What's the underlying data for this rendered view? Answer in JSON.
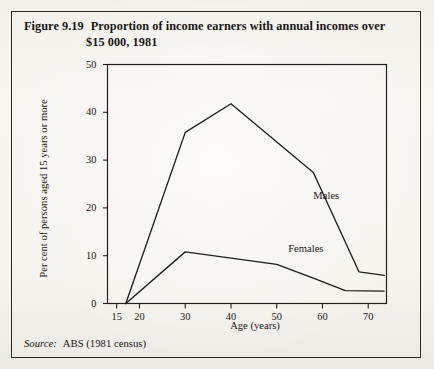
{
  "figure": {
    "number": "Figure 9.19",
    "title_line1": "Proportion of income earners with annual incomes over",
    "title_line2": "$15 000, 1981",
    "source_key": "Source:",
    "source_value": "ABS (1981 census)"
  },
  "chart_data": {
    "type": "line",
    "title": "Proportion of income earners with annual incomes over $15 000, 1981",
    "xlabel": "Age (years)",
    "ylabel": "Per cent of persons aged 15 years or more",
    "xlim": [
      13,
      74
    ],
    "ylim": [
      0,
      50
    ],
    "xticks": [
      15,
      20,
      30,
      40,
      50,
      60,
      70
    ],
    "xtick_labels": [
      "15",
      "20",
      "30",
      "40",
      "50",
      "60",
      "70"
    ],
    "yticks": [
      0,
      10,
      20,
      30,
      40,
      50
    ],
    "ytick_labels": [
      "0",
      "10",
      "20",
      "30",
      "40",
      "50"
    ],
    "grid": false,
    "legend": "inline-annotations",
    "line_color": "#211e1b",
    "series": [
      {
        "name": "Males",
        "label_x": 58,
        "label_y": 22.5,
        "points": [
          {
            "x": 17,
            "y": 0
          },
          {
            "x": 30,
            "y": 35.8
          },
          {
            "x": 40,
            "y": 41.8
          },
          {
            "x": 58,
            "y": 27.4
          },
          {
            "x": 68,
            "y": 6.6
          },
          {
            "x": 73.5,
            "y": 5.9
          }
        ]
      },
      {
        "name": "Females",
        "label_x": 52.5,
        "label_y": 11.3,
        "points": [
          {
            "x": 17,
            "y": 0
          },
          {
            "x": 30,
            "y": 10.8
          },
          {
            "x": 50,
            "y": 8.2
          },
          {
            "x": 58,
            "y": 5.3
          },
          {
            "x": 65,
            "y": 2.7
          },
          {
            "x": 73.5,
            "y": 2.6
          }
        ]
      }
    ]
  }
}
